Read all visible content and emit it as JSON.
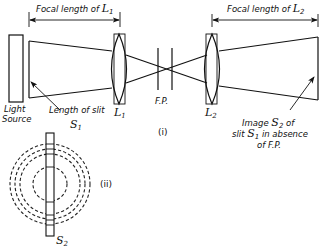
{
  "figure": {
    "part_i_label": "(i)",
    "part_ii_label": "(ii)",
    "focal_length_L1": {
      "prefix": "Focal length of ",
      "symbol": "L",
      "subscript": "1"
    },
    "focal_length_L2": {
      "prefix": "Focal length of ",
      "symbol": "L",
      "subscript": "2"
    },
    "light_source": [
      "Light",
      "Source"
    ],
    "slit_length": {
      "text": "Length of slit",
      "symbol": "S",
      "subscript": "1"
    },
    "lens1": {
      "symbol": "L",
      "subscript": "1"
    },
    "lens2": {
      "symbol": "L",
      "subscript": "2"
    },
    "fabry_perot": "F.P.",
    "image_label": {
      "line1_prefix": "Image ",
      "line1_symbol": "S",
      "line1_subscript": "2",
      "line1_suffix": " of",
      "line2_prefix": "slit ",
      "line2_symbol": "S",
      "line2_subscript": "1",
      "line2_suffix": " in absence",
      "line3": "of F.P."
    },
    "slit_s2": {
      "symbol": "S",
      "subscript": "2"
    }
  }
}
